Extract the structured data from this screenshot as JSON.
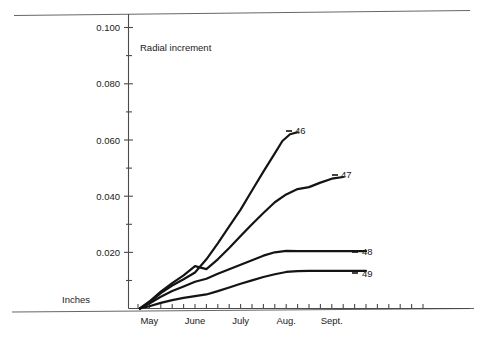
{
  "chart_data": {
    "type": "line",
    "title": "",
    "annotation": "Radial increment",
    "unit_label": "Inches",
    "xlabel": "",
    "ylabel": "Inches",
    "ylim": [
      0,
      0.106
    ],
    "xlim": [
      0,
      10
    ],
    "grid": false,
    "legend_position": "line-end-labels",
    "y_ticks_major": [
      0.02,
      0.04,
      0.06,
      0.08,
      0.1
    ],
    "y_ticks_major_labels": [
      "0.020",
      "0.040",
      "0.060",
      "0.080",
      "0.100"
    ],
    "y_ticks_minor": [
      0.01,
      0.03,
      0.05,
      0.07,
      0.09
    ],
    "x_tick_labels": [
      "May",
      "June",
      "July",
      "Aug.",
      "Sept."
    ],
    "x_tick_positions": [
      0.55,
      1.75,
      2.95,
      4.15,
      5.35
    ],
    "x_minor_tick_count": 26,
    "series": [
      {
        "name": "46",
        "label": "46",
        "x": [
          0.3,
          0.55,
          0.85,
          1.15,
          1.45,
          1.75,
          2.05,
          2.35,
          2.65,
          2.95,
          3.25,
          3.55,
          3.85,
          4.05,
          4.25,
          4.45
        ],
        "values": [
          0.0,
          0.0022,
          0.0055,
          0.0082,
          0.0104,
          0.0128,
          0.0175,
          0.0232,
          0.0292,
          0.0352,
          0.042,
          0.0487,
          0.0552,
          0.0596,
          0.062,
          0.0627
        ]
      },
      {
        "name": "47",
        "label": "47",
        "x": [
          0.3,
          0.55,
          0.85,
          1.15,
          1.45,
          1.75,
          2.05,
          2.35,
          2.65,
          2.95,
          3.25,
          3.55,
          3.85,
          4.15,
          4.45,
          4.75,
          5.05,
          5.35,
          5.65
        ],
        "values": [
          0.0,
          0.0025,
          0.006,
          0.009,
          0.0118,
          0.0151,
          0.014,
          0.0175,
          0.0215,
          0.0258,
          0.03,
          0.034,
          0.0378,
          0.0406,
          0.0425,
          0.0432,
          0.0448,
          0.0462,
          0.0468
        ]
      },
      {
        "name": "48",
        "label": "48",
        "x": [
          0.3,
          0.55,
          0.85,
          1.15,
          1.45,
          1.75,
          2.05,
          2.35,
          2.65,
          2.95,
          3.25,
          3.55,
          3.85,
          4.15,
          4.45,
          4.75,
          5.05,
          5.35,
          5.65,
          5.95,
          6.25
        ],
        "values": [
          0.0,
          0.0018,
          0.0042,
          0.0062,
          0.0078,
          0.0095,
          0.0106,
          0.0124,
          0.014,
          0.0156,
          0.0172,
          0.0188,
          0.02,
          0.0205,
          0.0204,
          0.0204,
          0.0204,
          0.0204,
          0.0204,
          0.0204,
          0.0204
        ]
      },
      {
        "name": "49",
        "label": "49",
        "x": [
          0.3,
          0.55,
          0.85,
          1.15,
          1.45,
          1.75,
          2.05,
          2.35,
          2.65,
          2.95,
          3.25,
          3.55,
          3.85,
          4.15,
          4.45,
          4.75,
          5.05,
          5.35,
          5.65,
          5.95,
          6.25
        ],
        "values": [
          0.0,
          0.0008,
          0.002,
          0.003,
          0.0038,
          0.0044,
          0.005,
          0.0062,
          0.0075,
          0.0088,
          0.01,
          0.0112,
          0.0122,
          0.013,
          0.0133,
          0.0134,
          0.0134,
          0.0134,
          0.0134,
          0.0134,
          0.0134
        ]
      }
    ],
    "series_label_positions": [
      {
        "name": "46",
        "x": 295,
        "y": 134
      },
      {
        "name": "47",
        "x": 341,
        "y": 178
      },
      {
        "name": "48",
        "x": 362,
        "y": 255
      },
      {
        "name": "49",
        "x": 362,
        "y": 277
      }
    ],
    "colors": {
      "line": "#141414",
      "axis": "#4a4a4a",
      "text": "#1a1a1a",
      "background": "#ffffff"
    }
  },
  "page_rules": {
    "top_rule": "horizontal-rule-top",
    "bottom_rule": "horizontal-rule-bottom"
  }
}
